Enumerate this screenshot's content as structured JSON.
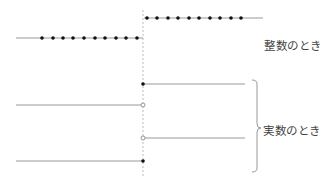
{
  "labels": {
    "integer_case": "整数のとき",
    "real_case": "実数のとき"
  },
  "colors": {
    "line": "#999999",
    "dot": "#111111",
    "dashed_axis": "#bbbbbb",
    "text": "#444444"
  },
  "geometry": {
    "jump_x": 143,
    "integer_case": {
      "left_line": {
        "y": 38,
        "x1": 16,
        "x2": 143,
        "dots_x": [
          42,
          53,
          63,
          73,
          84,
          95,
          105,
          116,
          126,
          137
        ]
      },
      "right_line": {
        "y": 18,
        "x1": 144,
        "x2": 263,
        "dots_x": [
          147,
          157,
          168,
          178,
          189,
          199,
          210,
          220,
          231,
          241
        ]
      }
    },
    "real_case": {
      "segments": [
        {
          "side": "right",
          "y": 84,
          "endpoint": "closed"
        },
        {
          "side": "left",
          "y": 105,
          "endpoint": "open"
        },
        {
          "side": "right",
          "y": 138,
          "endpoint": "open"
        },
        {
          "side": "left",
          "y": 161,
          "endpoint": "closed"
        }
      ]
    }
  }
}
